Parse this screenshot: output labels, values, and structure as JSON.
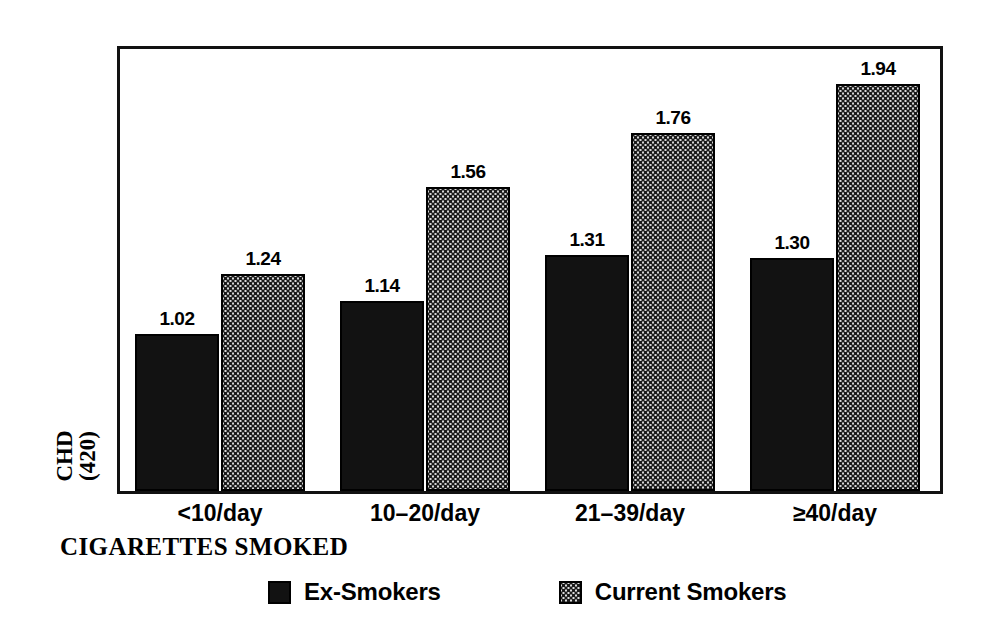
{
  "chart_data": {
    "type": "bar",
    "title": "",
    "xlabel": "CIGARETTES SMOKED",
    "ylabel": "CHD (420)",
    "ylabel_lines": [
      "CHD",
      "(420)"
    ],
    "categories": [
      "<10/day",
      "10–20/day",
      "21–39/day",
      "≥40/day"
    ],
    "series": [
      {
        "name": "Ex-Smokers",
        "color": "#121212",
        "pattern": "solid-black",
        "values": [
          1.02,
          1.14,
          1.31,
          1.3
        ],
        "labels": [
          "1.02",
          "1.14",
          "1.31",
          "1.30"
        ]
      },
      {
        "name": "Current Smokers",
        "color": "#d8d8d8",
        "pattern": "stipple-dotted",
        "values": [
          1.24,
          1.56,
          1.76,
          1.94
        ],
        "labels": [
          "1.24",
          "1.56",
          "1.76",
          "1.94"
        ]
      }
    ],
    "ylim": [
      0.44,
      2.07
    ],
    "grid": false,
    "y_ticks_shown": false,
    "legend_position": "bottom",
    "frame": true
  },
  "legend": {
    "items": [
      {
        "label": "Ex-Smokers",
        "swatch": "black-square-icon"
      },
      {
        "label": "Current Smokers",
        "swatch": "dotted-square-icon"
      }
    ]
  }
}
